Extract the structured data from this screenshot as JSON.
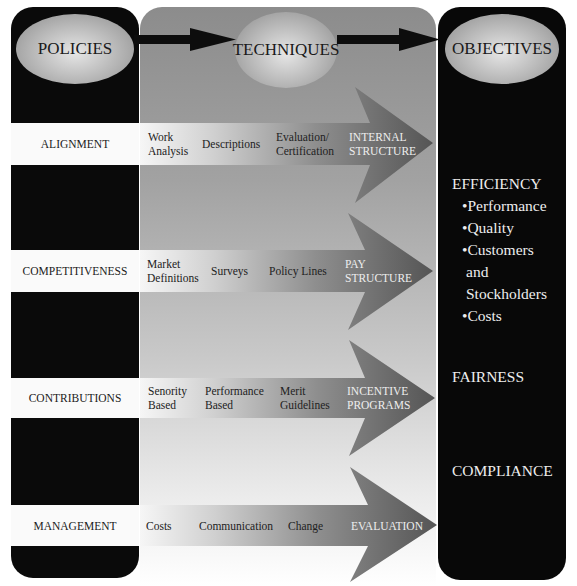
{
  "headers": {
    "policies": "POLICIES",
    "techniques": "TECHNIQUES",
    "objectives": "OBJECTIVES"
  },
  "rows": [
    {
      "policy": "ALIGNMENT",
      "techniques": [
        {
          "line1": "Work",
          "line2": "Analysis"
        },
        {
          "line1": "Descriptions",
          "line2": ""
        },
        {
          "line1": "Evaluation/",
          "line2": "Certification"
        }
      ],
      "outcome": {
        "line1": "INTERNAL",
        "line2": "STRUCTURE"
      }
    },
    {
      "policy": "COMPETITIVENESS",
      "techniques": [
        {
          "line1": "Market",
          "line2": "Definitions"
        },
        {
          "line1": "Surveys",
          "line2": ""
        },
        {
          "line1": "Policy Lines",
          "line2": ""
        }
      ],
      "outcome": {
        "line1": "PAY",
        "line2": "STRUCTURE"
      }
    },
    {
      "policy": "CONTRIBUTIONS",
      "techniques": [
        {
          "line1": "Senority",
          "line2": "Based"
        },
        {
          "line1": "Performance",
          "line2": "Based"
        },
        {
          "line1": "Merit",
          "line2": "Guidelines"
        }
      ],
      "outcome": {
        "line1": "INCENTIVE",
        "line2": "PROGRAMS"
      }
    },
    {
      "policy": "MANAGEMENT",
      "techniques": [
        {
          "line1": "Costs",
          "line2": ""
        },
        {
          "line1": "Communication",
          "line2": ""
        },
        {
          "line1": "Change",
          "line2": ""
        }
      ],
      "outcome": {
        "line1": "EVALUATION",
        "line2": ""
      }
    }
  ],
  "objectives": {
    "efficiency": {
      "title": "EFFICIENCY",
      "items": [
        "•Performance",
        "•Quality",
        "•Customers",
        "and",
        "Stockholders",
        "•Costs"
      ]
    },
    "fairness": "FAIRNESS",
    "compliance": "COMPLIANCE"
  },
  "colors": {
    "panel_dark": "#0a0a0a",
    "stripe": "#fafafa",
    "arrow_dark": "#5a5a5a"
  }
}
